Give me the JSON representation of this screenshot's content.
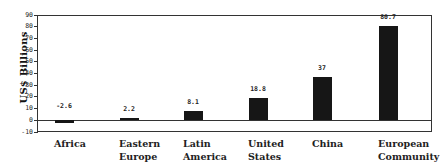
{
  "chart_data": {
    "type": "bar",
    "title": "",
    "xlabel": "",
    "ylabel": "US$ Billions",
    "ylim": [
      -10,
      90
    ],
    "yticks": [
      -10,
      0,
      10,
      20,
      30,
      40,
      50,
      60,
      70,
      80,
      90
    ],
    "grid": false,
    "legend": null,
    "categories": [
      "Africa",
      "Eastern Europe",
      "Latin America",
      "United States",
      "China",
      "European Community"
    ],
    "category_lines": [
      [
        "Africa"
      ],
      [
        "Eastern",
        "Europe"
      ],
      [
        "Latin",
        "America"
      ],
      [
        "United",
        "States"
      ],
      [
        "China"
      ],
      [
        "European",
        "Community"
      ]
    ],
    "values": [
      -2.6,
      2.2,
      8.1,
      18.8,
      37,
      80.7
    ],
    "value_labels": [
      "-2.6",
      "2.2",
      "8.1",
      "18.8",
      "37",
      "80.7"
    ],
    "bar_color": "#161616"
  }
}
